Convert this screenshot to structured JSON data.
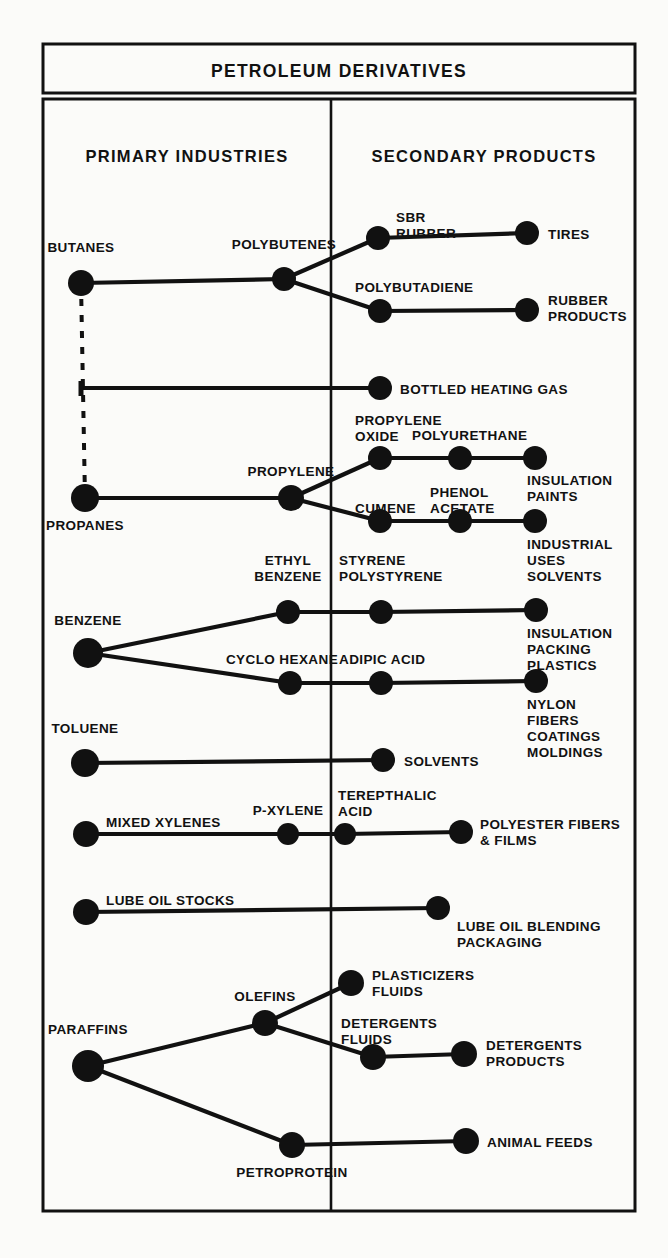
{
  "header": {
    "title": "PETROLEUM DERIVATIVES"
  },
  "columns": {
    "primary": "PRIMARY INDUSTRIES",
    "secondary": "SECONDARY PRODUCTS"
  },
  "chart_data": {
    "type": "diagram",
    "title": "PETROLEUM DERIVATIVES",
    "columns": [
      "PRIMARY INDUSTRIES",
      "SECONDARY PRODUCTS"
    ],
    "divider_x": 331,
    "nodes": [
      {
        "id": "butanes",
        "label": "BUTANES",
        "x": 81,
        "y": 283,
        "r": 13,
        "lx": 81,
        "ly": 252,
        "anchor": "middle",
        "col": "primary"
      },
      {
        "id": "polybutenes",
        "label": "POLYBUTENES",
        "x": 284,
        "y": 279,
        "r": 12,
        "lx": 284,
        "ly": 249,
        "anchor": "middle",
        "col": "primary"
      },
      {
        "id": "sbr-rubber",
        "label": "SBR\nRUBBER",
        "x": 378,
        "y": 238,
        "r": 12,
        "lx": 396,
        "ly": 222,
        "anchor": "start",
        "col": "secondary"
      },
      {
        "id": "tires",
        "label": "TIRES",
        "x": 527,
        "y": 233,
        "r": 12,
        "lx": 548,
        "ly": 239,
        "anchor": "start",
        "col": "secondary"
      },
      {
        "id": "polybutadiene",
        "label": "POLYBUTADIENE",
        "x": 380,
        "y": 311,
        "r": 12,
        "lx": 355,
        "ly": 292,
        "anchor": "start",
        "col": "secondary"
      },
      {
        "id": "rubber-products",
        "label": "RUBBER\nPRODUCTS",
        "x": 527,
        "y": 310,
        "r": 12,
        "lx": 548,
        "ly": 305,
        "anchor": "start",
        "col": "secondary"
      },
      {
        "id": "bottled-gas",
        "label": "BOTTLED HEATING GAS",
        "x": 380,
        "y": 388,
        "r": 12,
        "lx": 400,
        "ly": 394,
        "anchor": "start",
        "col": "secondary"
      },
      {
        "id": "propanes",
        "label": "PROPANES",
        "x": 85,
        "y": 498,
        "r": 14,
        "lx": 85,
        "ly": 530,
        "anchor": "middle",
        "col": "primary"
      },
      {
        "id": "propylene",
        "label": "PROPYLENE",
        "x": 291,
        "y": 498,
        "r": 13,
        "lx": 291,
        "ly": 476,
        "anchor": "middle",
        "col": "primary"
      },
      {
        "id": "propylene-oxide",
        "label": "PROPYLENE\nOXIDE",
        "x": 380,
        "y": 458,
        "r": 12,
        "lx": 355,
        "ly": 425,
        "anchor": "start",
        "col": "secondary"
      },
      {
        "id": "polyurethane",
        "label": "POLYURETHANE",
        "x": 460,
        "y": 458,
        "r": 12,
        "lx": 412,
        "ly": 440,
        "anchor": "start",
        "col": "secondary"
      },
      {
        "id": "insul-paints",
        "label": "INSULATION\nPAINTS",
        "x": 535,
        "y": 458,
        "r": 12,
        "lx": 527,
        "ly": 485,
        "anchor": "start",
        "col": "secondary"
      },
      {
        "id": "cumene",
        "label": "CUMENE",
        "x": 380,
        "y": 521,
        "r": 12,
        "lx": 355,
        "ly": 513,
        "anchor": "start",
        "col": "secondary"
      },
      {
        "id": "phenol-acetate",
        "label": "PHENOL\nACETATE",
        "x": 460,
        "y": 521,
        "r": 12,
        "lx": 430,
        "ly": 497,
        "anchor": "start",
        "col": "secondary"
      },
      {
        "id": "industrial-uses",
        "label": "INDUSTRIAL\nUSES\nSOLVENTS",
        "x": 535,
        "y": 521,
        "r": 12,
        "lx": 527,
        "ly": 549,
        "anchor": "start",
        "col": "secondary"
      },
      {
        "id": "benzene",
        "label": "BENZENE",
        "x": 88,
        "y": 653,
        "r": 15,
        "lx": 88,
        "ly": 625,
        "anchor": "middle",
        "col": "primary"
      },
      {
        "id": "ethyl-benzene",
        "label": "ETHYL\nBENZENE",
        "x": 288,
        "y": 612,
        "r": 12,
        "lx": 288,
        "ly": 565,
        "anchor": "middle",
        "col": "primary"
      },
      {
        "id": "styrene",
        "label": "STYRENE\nPOLYSTYRENE",
        "x": 381,
        "y": 612,
        "r": 12,
        "lx": 339,
        "ly": 565,
        "anchor": "start",
        "col": "secondary"
      },
      {
        "id": "insul-packing",
        "label": "INSULATION\nPACKING\nPLASTICS",
        "x": 536,
        "y": 610,
        "r": 12,
        "lx": 527,
        "ly": 638,
        "anchor": "start",
        "col": "secondary"
      },
      {
        "id": "cyclo-hexane",
        "label": "CYCLO HEXANE",
        "x": 290,
        "y": 683,
        "r": 12,
        "lx": 282,
        "ly": 664,
        "anchor": "middle",
        "col": "primary"
      },
      {
        "id": "adipic-acid",
        "label": "ADIPIC ACID",
        "x": 381,
        "y": 683,
        "r": 12,
        "lx": 339,
        "ly": 664,
        "anchor": "start",
        "col": "secondary"
      },
      {
        "id": "nylon",
        "label": "NYLON\nFIBERS\nCOATINGS\nMOLDINGS",
        "x": 536,
        "y": 681,
        "r": 12,
        "lx": 527,
        "ly": 709,
        "anchor": "start",
        "col": "secondary"
      },
      {
        "id": "toluene",
        "label": "TOLUENE",
        "x": 85,
        "y": 763,
        "r": 14,
        "lx": 85,
        "ly": 733,
        "anchor": "middle",
        "col": "primary"
      },
      {
        "id": "solvents",
        "label": "SOLVENTS",
        "x": 383,
        "y": 760,
        "r": 12,
        "lx": 404,
        "ly": 766,
        "anchor": "start",
        "col": "secondary"
      },
      {
        "id": "mixed-xylenes",
        "label": "MIXED XYLENES",
        "x": 86,
        "y": 834,
        "r": 13,
        "lx": 106,
        "ly": 827,
        "anchor": "start",
        "col": "primary"
      },
      {
        "id": "p-xylene",
        "label": "P-XYLENE",
        "x": 288,
        "y": 834,
        "r": 11,
        "lx": 288,
        "ly": 815,
        "anchor": "middle",
        "col": "primary"
      },
      {
        "id": "terepthalic",
        "label": "TEREPTHALIC\nACID",
        "x": 345,
        "y": 834,
        "r": 11,
        "lx": 338,
        "ly": 800,
        "anchor": "start",
        "col": "secondary"
      },
      {
        "id": "polyester",
        "label": "POLYESTER FIBERS\n& FILMS",
        "x": 461,
        "y": 832,
        "r": 12,
        "lx": 480,
        "ly": 829,
        "anchor": "start",
        "col": "secondary"
      },
      {
        "id": "lube-oil-stocks",
        "label": "LUBE OIL STOCKS",
        "x": 86,
        "y": 912,
        "r": 13,
        "lx": 106,
        "ly": 905,
        "anchor": "start",
        "col": "primary"
      },
      {
        "id": "lube-blending",
        "label": "LUBE OIL BLENDING\nPACKAGING",
        "x": 438,
        "y": 908,
        "r": 12,
        "lx": 457,
        "ly": 931,
        "anchor": "start",
        "col": "secondary"
      },
      {
        "id": "olefins",
        "label": "OLEFINS",
        "x": 265,
        "y": 1023,
        "r": 13,
        "lx": 265,
        "ly": 1001,
        "anchor": "middle",
        "col": "primary"
      },
      {
        "id": "plasticizers",
        "label": "PLASTICIZERS\nFLUIDS",
        "x": 351,
        "y": 983,
        "r": 13,
        "lx": 372,
        "ly": 980,
        "anchor": "start",
        "col": "secondary"
      },
      {
        "id": "detergents-fl",
        "label": "DETERGENTS\nFLUIDS",
        "x": 373,
        "y": 1057,
        "r": 13,
        "lx": 341,
        "ly": 1028,
        "anchor": "start",
        "col": "secondary"
      },
      {
        "id": "detergents-pr",
        "label": "DETERGENTS\nPRODUCTS",
        "x": 464,
        "y": 1054,
        "r": 13,
        "lx": 486,
        "ly": 1050,
        "anchor": "start",
        "col": "secondary"
      },
      {
        "id": "paraffins",
        "label": "PARAFFINS",
        "x": 88,
        "y": 1066,
        "r": 16,
        "lx": 88,
        "ly": 1034,
        "anchor": "middle",
        "col": "primary"
      },
      {
        "id": "petroprotein",
        "label": "PETROPROTEIN",
        "x": 292,
        "y": 1145,
        "r": 13,
        "lx": 292,
        "ly": 1177,
        "anchor": "middle",
        "col": "primary"
      },
      {
        "id": "animal-feeds",
        "label": "ANIMAL FEEDS",
        "x": 466,
        "y": 1141,
        "r": 13,
        "lx": 487,
        "ly": 1147,
        "anchor": "start",
        "col": "secondary"
      }
    ],
    "edges": [
      {
        "from": "butanes",
        "to": "polybutenes",
        "style": "solid"
      },
      {
        "from": "polybutenes",
        "to": "sbr-rubber",
        "style": "solid"
      },
      {
        "from": "sbr-rubber",
        "to": "tires",
        "style": "solid"
      },
      {
        "from": "polybutenes",
        "to": "polybutadiene",
        "style": "solid"
      },
      {
        "from": "polybutadiene",
        "to": "rubber-products",
        "style": "solid"
      },
      {
        "from": "butanes",
        "to": "propanes",
        "style": "dashed"
      },
      {
        "from": "bottled-gas-tap",
        "to": "bottled-gas",
        "style": "solid"
      },
      {
        "from": "propanes",
        "to": "propylene",
        "style": "solid"
      },
      {
        "from": "propylene",
        "to": "propylene-oxide",
        "style": "solid"
      },
      {
        "from": "propylene-oxide",
        "to": "polyurethane",
        "style": "solid"
      },
      {
        "from": "polyurethane",
        "to": "insul-paints",
        "style": "solid"
      },
      {
        "from": "propylene",
        "to": "cumene",
        "style": "solid"
      },
      {
        "from": "cumene",
        "to": "phenol-acetate",
        "style": "solid"
      },
      {
        "from": "phenol-acetate",
        "to": "industrial-uses",
        "style": "solid"
      },
      {
        "from": "benzene",
        "to": "ethyl-benzene",
        "style": "solid"
      },
      {
        "from": "ethyl-benzene",
        "to": "styrene",
        "style": "solid"
      },
      {
        "from": "styrene",
        "to": "insul-packing",
        "style": "solid"
      },
      {
        "from": "benzene",
        "to": "cyclo-hexane",
        "style": "solid"
      },
      {
        "from": "cyclo-hexane",
        "to": "adipic-acid",
        "style": "solid"
      },
      {
        "from": "adipic-acid",
        "to": "nylon",
        "style": "solid"
      },
      {
        "from": "toluene",
        "to": "solvents",
        "style": "solid"
      },
      {
        "from": "mixed-xylenes",
        "to": "p-xylene",
        "style": "solid"
      },
      {
        "from": "p-xylene",
        "to": "terepthalic",
        "style": "solid"
      },
      {
        "from": "terepthalic",
        "to": "polyester",
        "style": "solid"
      },
      {
        "from": "lube-oil-stocks",
        "to": "lube-blending",
        "style": "solid"
      },
      {
        "from": "paraffins",
        "to": "olefins",
        "style": "solid"
      },
      {
        "from": "olefins",
        "to": "plasticizers",
        "style": "solid"
      },
      {
        "from": "olefins",
        "to": "detergents-fl",
        "style": "solid"
      },
      {
        "from": "detergents-fl",
        "to": "detergents-pr",
        "style": "solid"
      },
      {
        "from": "paraffins",
        "to": "petroprotein",
        "style": "solid"
      },
      {
        "from": "petroprotein",
        "to": "animal-feeds",
        "style": "solid"
      }
    ]
  },
  "style": {
    "ink": "#111111",
    "paper": "#fbfbf9"
  }
}
